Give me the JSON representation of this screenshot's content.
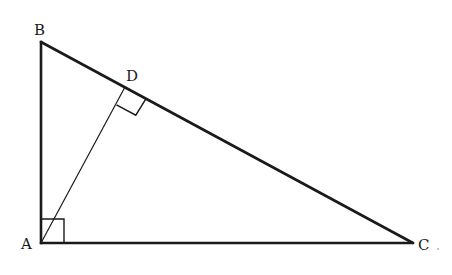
{
  "figure": {
    "points": {
      "A": {
        "label": "A",
        "x": 41,
        "y": 243
      },
      "B": {
        "label": "B",
        "x": 41,
        "y": 42
      },
      "C": {
        "label": "C",
        "x": 413,
        "y": 243
      },
      "D": {
        "label": "D",
        "x": 125,
        "y": 87
      }
    },
    "segments": [
      {
        "from": "A",
        "to": "B",
        "style": "thick"
      },
      {
        "from": "B",
        "to": "C",
        "style": "thick"
      },
      {
        "from": "A",
        "to": "C",
        "style": "thick"
      },
      {
        "from": "A",
        "to": "D",
        "style": "thin"
      }
    ],
    "right_angle_marks": [
      {
        "at": "A",
        "between": [
          "B",
          "C"
        ]
      },
      {
        "at": "D",
        "between": [
          "A",
          "C"
        ]
      }
    ],
    "labels": {
      "A": "A",
      "B": "B",
      "C": "C",
      "D": "D"
    },
    "colors": {
      "stroke": "#1a1a1a",
      "background": "#ffffff"
    }
  }
}
